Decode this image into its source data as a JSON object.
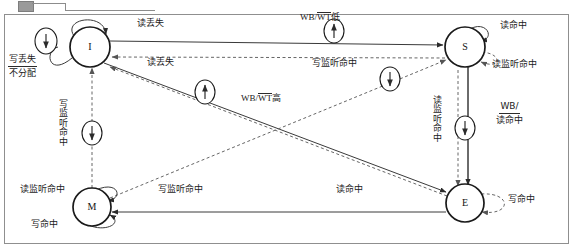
{
  "diagram": {
    "title_alt": "MESI cache coherence state transition diagram",
    "type": "state-diagram",
    "colors": {
      "node_stroke": "#1a1a1a",
      "solid_edge": "#3a3a3a",
      "dashed_edge": "#6b6b6b",
      "text": "#1a1a1a",
      "background": "#ffffff"
    },
    "nodes": [
      {
        "id": "I",
        "label": "I",
        "x": 90,
        "y": 47,
        "r": 20
      },
      {
        "id": "S",
        "label": "S",
        "x": 465,
        "y": 47,
        "r": 20
      },
      {
        "id": "M",
        "label": "M",
        "x": 92,
        "y": 207,
        "r": 19
      },
      {
        "id": "E",
        "label": "E",
        "x": 465,
        "y": 203,
        "r": 19
      }
    ],
    "markers": [
      {
        "id": "m1",
        "glyph": "down-arrow",
        "x": 46,
        "y": 41
      },
      {
        "id": "m2",
        "glyph": "up-arrow",
        "x": 334,
        "y": 31
      },
      {
        "id": "m3",
        "glyph": "up-arrow",
        "x": 205,
        "y": 92
      },
      {
        "id": "m4",
        "glyph": "down-arrow",
        "x": 390,
        "y": 79
      },
      {
        "id": "m5",
        "glyph": "down-arrow",
        "x": 92,
        "y": 133
      },
      {
        "id": "m6",
        "glyph": "down-arrow",
        "x": 465,
        "y": 128
      }
    ],
    "labels": [
      {
        "id": "l-write-miss",
        "text": "写丢失",
        "x": 10,
        "y": 57
      },
      {
        "id": "l-no-allocate",
        "text": "不分配",
        "x": 10,
        "y": 80
      },
      {
        "id": "l-read-miss-top",
        "text": "读丢失",
        "x": 137,
        "y": 23
      },
      {
        "id": "l-wb-wt-low",
        "text": "WB/",
        "x": 300,
        "y": 15,
        "overline": "WT",
        "suffix": "低"
      },
      {
        "id": "l-read-hit-s",
        "text": "读命中",
        "x": 500,
        "y": 24
      },
      {
        "id": "l-read-miss-2",
        "text": "读丢失",
        "x": 147,
        "y": 61
      },
      {
        "id": "l-write-snoop-hit-1",
        "text": "写监听命中",
        "x": 316,
        "y": 62
      },
      {
        "id": "l-read-snoop-hit-s",
        "text": "读监听命中",
        "x": 495,
        "y": 63
      },
      {
        "id": "l-wb-wt-high-mid",
        "text": "WB/",
        "x": 241,
        "y": 96,
        "overline": "WT",
        "suffix": "高"
      },
      {
        "id": "l-write-hit-frac",
        "text": "写命中",
        "x": 503,
        "y": 104
      },
      {
        "id": "l-wb-wt-high-frac",
        "text": "WB/",
        "x": 497,
        "y": 122,
        "overline": "WT",
        "suffix": "高"
      },
      {
        "id": "l-read-hit-m",
        "text": "读命中",
        "x": 22,
        "y": 188
      },
      {
        "id": "l-read-snoop-hit-mid",
        "text": "读监听命中",
        "x": 158,
        "y": 188
      },
      {
        "id": "l-write-snoop-hit-2",
        "text": "写监听命中",
        "x": 336,
        "y": 188
      },
      {
        "id": "l-read-hit-e",
        "text": "读命中",
        "x": 508,
        "y": 197
      },
      {
        "id": "l-write-hit-m",
        "text": "写命中",
        "x": 33,
        "y": 222
      },
      {
        "id": "l-write-hit-bottom",
        "text": "写命中",
        "x": 253,
        "y": 220
      }
    ],
    "vertical_labels": [
      {
        "id": "v-write-snoop-hit",
        "text": "写监听命中",
        "x": 58,
        "y": 100
      },
      {
        "id": "v-read-snoop-hit",
        "text": "读监听命中",
        "x": 432,
        "y": 96
      }
    ],
    "transitions": [
      {
        "from": "I",
        "to": "I",
        "label": "写丢失 / 不分配",
        "style": "solid-selfloop"
      },
      {
        "from": "I",
        "to": "S",
        "label": "读丢失",
        "style": "solid"
      },
      {
        "from": "S",
        "to": "I",
        "label": "写监听命中",
        "style": "dashed"
      },
      {
        "from": "I",
        "to": "E",
        "label": "读丢失",
        "style": "solid"
      },
      {
        "from": "E",
        "to": "I",
        "label": "写监听命中",
        "style": "dashed"
      },
      {
        "from": "I",
        "to": "M",
        "label": "写监听命中",
        "style": "dashed"
      },
      {
        "from": "M",
        "to": "S",
        "label": "读监听命中",
        "style": "dashed"
      },
      {
        "from": "S",
        "to": "S",
        "label": "读命中",
        "style": "solid-selfloop"
      },
      {
        "from": "S",
        "to": "S",
        "label": "读监听命中",
        "style": "dashed-selfloop"
      },
      {
        "from": "S",
        "to": "E",
        "label": "读监听命中",
        "style": "dashed"
      },
      {
        "from": "E",
        "to": "S",
        "label": "写命中 / WB/WT高",
        "style": "solid"
      },
      {
        "from": "M",
        "to": "M",
        "label": "读命中",
        "style": "solid-selfloop"
      },
      {
        "from": "M",
        "to": "M",
        "label": "写命中",
        "style": "solid-selfloop"
      },
      {
        "from": "E",
        "to": "E",
        "label": "读命中",
        "style": "dashed-selfloop"
      },
      {
        "from": "E",
        "to": "M",
        "label": "写命中",
        "style": "solid"
      }
    ]
  }
}
